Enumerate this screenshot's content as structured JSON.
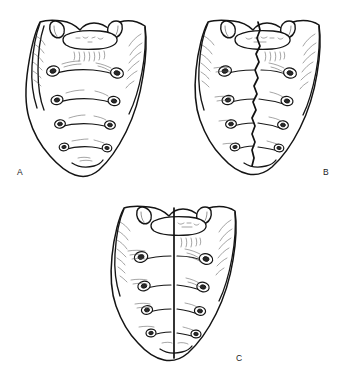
{
  "figure": {
    "kind": "anatomical-line-illustration",
    "view": "anterior (pelvic) surface",
    "background_color": "#ffffff",
    "line_color": "#141414",
    "panel_count": 3,
    "panels": [
      {
        "id": "a",
        "label": "A",
        "label_position": "bottom-left",
        "description": "Anterior view of sacrum, intact median ridge",
        "midline": "none",
        "foramina_pairs": 4,
        "transverse_ridges": 4,
        "superior_articular_processes": 2
      },
      {
        "id": "b",
        "label": "B",
        "label_position": "bottom-right",
        "description": "Anterior view of sacrum with irregular midline fissure",
        "midline": "irregular-wavy-cleft",
        "foramina_pairs": 4,
        "transverse_ridges": 4,
        "superior_articular_processes": 2
      },
      {
        "id": "c",
        "label": "C",
        "label_position": "bottom-right",
        "description": "Anterior view of sacrum with complete straight sagittal cleft",
        "midline": "straight-complete-cleft",
        "foramina_pairs": 4,
        "transverse_ridges": 4,
        "superior_articular_processes": 2
      }
    ]
  }
}
